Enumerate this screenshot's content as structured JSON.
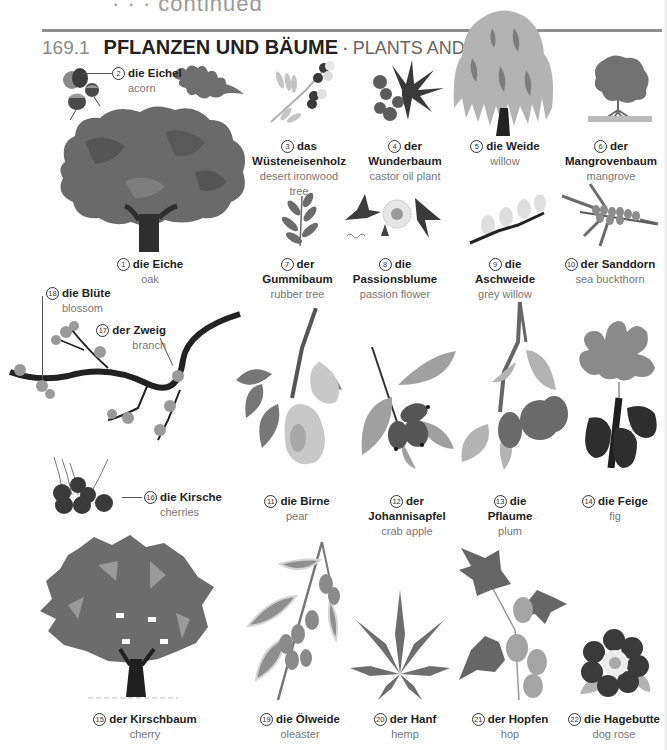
{
  "page": {
    "clipped_header": "· · · continued",
    "section_number": "169.1",
    "title_de": "PFLANZEN UND BÄUME",
    "separator": "·",
    "title_en": "PLANTS AND TREES"
  },
  "items": [
    {
      "n": "1",
      "de": "die Eiche",
      "en": "oak",
      "icon": "oak-tree-icon"
    },
    {
      "n": "2",
      "de": "die Eichel",
      "en": "acorn",
      "icon": "acorn-icon"
    },
    {
      "n": "3",
      "de": "das Wüsteneisenholz",
      "en": "desert ironwood",
      "en2": "tree",
      "icon": "ironwood-branch-icon"
    },
    {
      "n": "4",
      "de": "der Wunderbaum",
      "en": "castor oil plant",
      "icon": "castor-plant-icon"
    },
    {
      "n": "5",
      "de": "die Weide",
      "en": "willow",
      "icon": "willow-tree-icon"
    },
    {
      "n": "6",
      "de": "der Mangrovenbaum",
      "en": "mangrove",
      "icon": "mangrove-tree-icon"
    },
    {
      "n": "7",
      "de": "der Gummibaum",
      "en": "rubber tree",
      "icon": "rubber-tree-leaves-icon"
    },
    {
      "n": "8",
      "de": "die",
      "de2": "Passionsblume",
      "en": "passion flower",
      "icon": "passion-flower-icon"
    },
    {
      "n": "9",
      "de": "die Aschweide",
      "en": "grey willow",
      "icon": "grey-willow-twig-icon"
    },
    {
      "n": "10",
      "de": "der Sanddorn",
      "en": "sea buckthorn",
      "icon": "sea-buckthorn-icon"
    },
    {
      "n": "11",
      "de": "die Birne",
      "en": "pear",
      "icon": "pear-icon"
    },
    {
      "n": "12",
      "de": "der Johannisapfel",
      "en": "crab apple",
      "icon": "crab-apple-icon"
    },
    {
      "n": "13",
      "de": "die Pflaume",
      "en": "plum",
      "icon": "plum-icon"
    },
    {
      "n": "14",
      "de": "die Feige",
      "en": "fig",
      "icon": "fig-icon"
    },
    {
      "n": "15",
      "de": "der Kirschbaum",
      "en": "cherry",
      "icon": "cherry-tree-icon"
    },
    {
      "n": "16",
      "de": "die Kirsche",
      "en": "cherries",
      "icon": "cherries-icon"
    },
    {
      "n": "17",
      "de": "der Zweig",
      "en": "branch",
      "icon": "branch-icon"
    },
    {
      "n": "18",
      "de": "die Blüte",
      "en": "blossom",
      "icon": "blossom-icon"
    },
    {
      "n": "19",
      "de": "die Ölweide",
      "en": "oleaster",
      "icon": "oleaster-icon"
    },
    {
      "n": "20",
      "de": "der Hanf",
      "en": "hemp",
      "icon": "hemp-leaf-icon"
    },
    {
      "n": "21",
      "de": "der Hopfen",
      "en": "hop",
      "icon": "hop-icon"
    },
    {
      "n": "22",
      "de": "die Hagebutte",
      "en": "dog rose",
      "icon": "dog-rose-icon"
    }
  ],
  "colors": {
    "rule": "#8f8f8f",
    "text_de": "#222222",
    "text_en": "#777777",
    "foliage_dark": "#5f5f5f",
    "foliage_mid": "#7a7a7a",
    "foliage_light": "#b5b5b5",
    "trunk": "#2a2a2a"
  }
}
